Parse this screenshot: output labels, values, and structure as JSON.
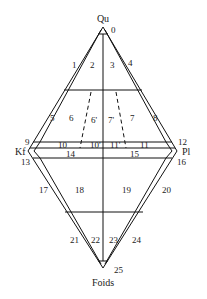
{
  "diagram": {
    "type": "QAPF double-triangle classification diagram",
    "vertices": {
      "top": "Qu",
      "left": "Kf",
      "right": "Pl",
      "bottom": "Foids"
    },
    "fields": {
      "f0": "0",
      "f1": "1",
      "f2": "2",
      "f3": "3",
      "f4": "4",
      "f5": "5",
      "f6": "6",
      "f6p": "6'",
      "f7p": "7'",
      "f7": "7",
      "f8": "8",
      "f9": "9",
      "f10": "10",
      "f10p": "10'",
      "f11p": "11'",
      "f11": "11",
      "f12": "12",
      "f13": "13",
      "f14": "14",
      "f15": "15",
      "f16": "16",
      "f17": "17",
      "f18": "18",
      "f19": "19",
      "f20": "20",
      "f21": "21",
      "f22": "22",
      "f23": "23",
      "f24": "24",
      "f25": "25"
    },
    "colors": {
      "line": "#111111",
      "text": "#222222",
      "background": "#ffffff"
    }
  }
}
